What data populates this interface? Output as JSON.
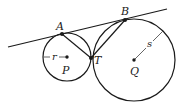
{
  "diagram": {
    "type": "geometry",
    "points": {
      "A": {
        "label": "A",
        "x": 62,
        "y": 34
      },
      "B": {
        "label": "B",
        "x": 125,
        "y": 20
      },
      "T": {
        "label": "T",
        "x": 91,
        "y": 58
      },
      "P": {
        "label": "P",
        "x": 67,
        "y": 57
      },
      "Q": {
        "label": "Q",
        "x": 134,
        "y": 60
      }
    },
    "circles": [
      {
        "center": "P",
        "radius_label": "r",
        "r": 24
      },
      {
        "center": "Q",
        "radius_label": "s",
        "r": 41
      }
    ],
    "segments": [
      {
        "from": "A",
        "to": "T"
      },
      {
        "from": "B",
        "to": "T"
      }
    ],
    "tangent_line": {
      "x1": 8,
      "y1": 47,
      "x2": 167,
      "y2": 9
    },
    "labels": {
      "A": "A",
      "B": "B",
      "T": "T",
      "P": "P",
      "Q": "Q",
      "r": "r",
      "s": "s"
    },
    "colors": {
      "stroke": "#1a1a1a",
      "radius": "#555555"
    }
  }
}
